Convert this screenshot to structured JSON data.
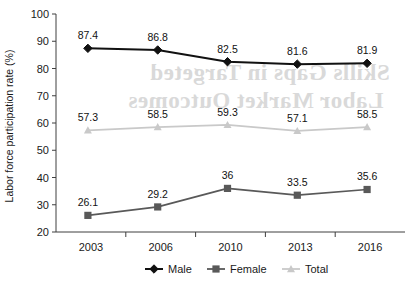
{
  "chart_data": {
    "type": "line",
    "title": "",
    "xlabel": "",
    "ylabel": "Labor force participation rate (%)",
    "categories": [
      "2003",
      "2006",
      "2010",
      "2013",
      "2016"
    ],
    "ylim": [
      20,
      100
    ],
    "yticks": [
      20,
      30,
      40,
      50,
      60,
      70,
      80,
      90,
      100
    ],
    "ytick_labels": [
      "20",
      "30",
      "40",
      "50",
      "60",
      "70",
      "80",
      "90",
      "100"
    ],
    "grid": false,
    "legend_position": "bottom",
    "series": [
      {
        "name": "Male",
        "color": "#111111",
        "marker": "diamond",
        "values": [
          87.4,
          86.8,
          82.5,
          81.6,
          81.9
        ],
        "labels": [
          "87.4",
          "86.8",
          "82.5",
          "81.6",
          "81.9"
        ]
      },
      {
        "name": "Female",
        "color": "#595959",
        "marker": "square",
        "values": [
          26.1,
          29.2,
          36,
          33.5,
          35.6
        ],
        "labels": [
          "26.1",
          "29.2",
          "36",
          "33.5",
          "35.6"
        ]
      },
      {
        "name": "Total",
        "color": "#c9c9c9",
        "marker": "triangle",
        "values": [
          57.3,
          58.5,
          59.3,
          57.1,
          58.5
        ],
        "labels": [
          "57.3",
          "58.5",
          "59.3",
          "57.1",
          "58.5"
        ]
      }
    ]
  },
  "legend": {
    "items": [
      {
        "label": "Male"
      },
      {
        "label": "Female"
      },
      {
        "label": "Total"
      }
    ]
  },
  "background_artifact": {
    "line1": "Skills Gaps in Targeted",
    "line2": "Labor Market Outcomes"
  }
}
